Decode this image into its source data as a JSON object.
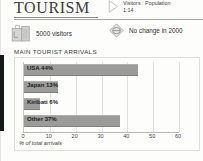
{
  "header": {
    "title": "TOURISM",
    "ratio_icon": "triangle-right-icon",
    "ratio_label": "Visitors : Population",
    "ratio_value": "1:14"
  },
  "stats": [
    {
      "icon": "suitcase-icon",
      "label": "5000 visitors"
    },
    {
      "icon": "no-change-diamond-icon",
      "label": "No change in 2000"
    }
  ],
  "chart_data": {
    "type": "bar",
    "orientation": "horizontal",
    "title": "MAIN TOURIST ARRIVALS",
    "categories": [
      "USA",
      "Japan",
      "Kiribati",
      "Other"
    ],
    "values": [
      44,
      13,
      6,
      37
    ],
    "bar_labels": [
      "USA 44%",
      "Japan 13%",
      "Kiribati 6%",
      "Other 37%"
    ],
    "xlabel": "% of total arrivals",
    "ylabel": "",
    "xlim": [
      0,
      60
    ],
    "ticks": [
      0,
      10,
      20,
      30,
      40,
      50,
      60
    ],
    "tick_labels": [
      "0",
      "10",
      "20",
      "30",
      "40",
      "50",
      "60"
    ],
    "grid": true,
    "legend": "none",
    "bar_color": "#9b9b99",
    "axis_color": "#b9b8b4"
  }
}
